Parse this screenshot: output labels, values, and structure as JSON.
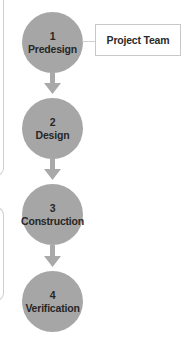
{
  "diagram": {
    "phases": [
      {
        "number": "1",
        "label": "Predesign"
      },
      {
        "number": "2",
        "label": "Design"
      },
      {
        "number": "3",
        "label": "Construction"
      },
      {
        "number": "4",
        "label": "Verification"
      }
    ],
    "side_box": {
      "label": "Project Team",
      "attached_to_phase": "1"
    },
    "colors": {
      "phase_fill": "#a6a6a6",
      "arrow_fill": "#a9a9a9",
      "text": "#262626",
      "lines": "#cfcfcf"
    }
  }
}
